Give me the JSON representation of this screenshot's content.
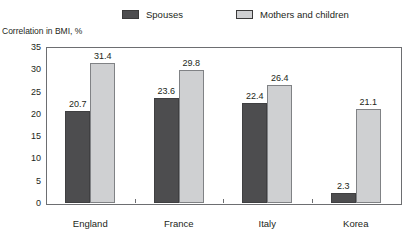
{
  "legend": {
    "items": [
      {
        "label": "Spouses",
        "color": "#4d4d4f",
        "icon": "square-swatch-icon"
      },
      {
        "label": "Mothers and children",
        "color": "#cfd0d2",
        "icon": "square-swatch-icon"
      }
    ]
  },
  "axis_title": "Correlation in BMI, %",
  "yticks": [
    "35",
    "30",
    "25",
    "20",
    "15",
    "10",
    "5",
    "0"
  ],
  "chart_data": {
    "type": "bar",
    "title": "",
    "subtitle": "",
    "xlabel": "",
    "ylabel": "Correlation in BMI, %",
    "ylim": [
      0,
      35
    ],
    "ytick_values": [
      0,
      5,
      10,
      15,
      20,
      25,
      30,
      35
    ],
    "grid": false,
    "legend_position": "top",
    "categories": [
      "England",
      "France",
      "Italy",
      "Korea"
    ],
    "series": [
      {
        "name": "Spouses",
        "color": "#4d4d4f",
        "values": [
          20.7,
          23.6,
          22.4,
          2.3
        ],
        "labels": [
          "20.7",
          "23.6",
          "22.4",
          "2.3"
        ]
      },
      {
        "name": "Mothers and children",
        "color": "#cfd0d2",
        "values": [
          31.4,
          29.8,
          26.4,
          21.1
        ],
        "labels": [
          "31.4",
          "29.8",
          "26.4",
          "21.1"
        ]
      }
    ]
  }
}
